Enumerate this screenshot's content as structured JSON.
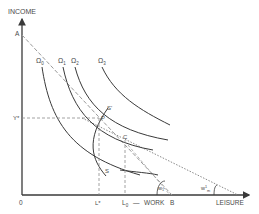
{
  "axes": {
    "y_label": "INCOME",
    "x_label": "LEISURE",
    "origin": "0",
    "work_label": "WORK",
    "work_arrow": "—"
  },
  "points": {
    "A": "A",
    "B": "B",
    "P": "P",
    "C": "C",
    "S": "S",
    "S_prime": "S'",
    "Y_star": "Y*",
    "L_star": "L*",
    "L0": "L",
    "L0_sub": "0"
  },
  "curves": [
    {
      "name": "Ω",
      "sub": "0"
    },
    {
      "name": "Ω",
      "sub": "1"
    },
    {
      "name": "Ω",
      "sub": "2"
    },
    {
      "name": "Ω",
      "sub": "3"
    }
  ],
  "angles": {
    "w1": "w",
    "w1_sub": "1",
    "wm": "w",
    "wm_sup": "1",
    "wm_sub": "m"
  },
  "colors": {
    "line": "#3a3a3a",
    "dashed": "#9a9a9a",
    "dotted": "#8a8a8a",
    "text": "#4a4a4a"
  }
}
